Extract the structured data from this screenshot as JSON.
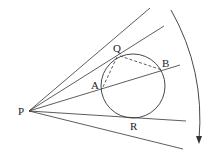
{
  "diagram": {
    "type": "geometry",
    "colors": {
      "stroke": "#333333",
      "background": "#ffffff",
      "label": "#222222"
    },
    "labels": {
      "P": "P",
      "Q": "Q",
      "A": "A",
      "B": "B",
      "R": "R"
    },
    "points": {
      "P": [
        29,
        111
      ],
      "Q": [
        120,
        55
      ],
      "A": [
        102,
        89
      ],
      "B": [
        162,
        70
      ],
      "R": [
        132,
        117
      ]
    },
    "circle": {
      "cx": 133,
      "cy": 86,
      "r": 32
    },
    "rays": [
      {
        "name": "ray-top",
        "to": [
          150,
          8
        ]
      },
      {
        "name": "ray-tangent-q",
        "to": [
          164,
          26
        ]
      },
      {
        "name": "ray-secant-ab",
        "to": [
          180,
          65
        ]
      },
      {
        "name": "ray-tangent-r",
        "to": [
          186,
          121
        ]
      },
      {
        "name": "ray-bottom",
        "to": [
          183,
          149
        ]
      }
    ],
    "dashed_segments": [
      {
        "name": "segment-qa",
        "from": "Q",
        "to": "A"
      },
      {
        "name": "segment-qb",
        "from": "Q",
        "to": "B"
      }
    ],
    "rotation_arrow": {
      "start": [
        171,
        10
      ],
      "end": [
        199,
        142
      ],
      "direction": "clockwise"
    }
  }
}
